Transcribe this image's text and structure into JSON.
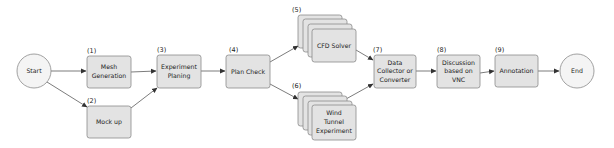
{
  "diagram": {
    "type": "flowchart",
    "colors": {
      "box_fill": "#e3e3e3",
      "box_stroke": "#8a8a8a",
      "circle_fill": "#f4f4f4",
      "edge": "#444444",
      "background": "#ffffff"
    },
    "nodes": {
      "start": {
        "label": "Start"
      },
      "n1": {
        "num": "(1)",
        "line1": "Mesh",
        "line2": "Generation"
      },
      "n2": {
        "num": "(2)",
        "line1": "Mock up"
      },
      "n3": {
        "num": "(3)",
        "line1": "Experiment",
        "line2": "Planing"
      },
      "n4": {
        "num": "(4)",
        "line1": "Plan Check"
      },
      "n5": {
        "num": "(5)",
        "line1": "CFD Solver"
      },
      "n6": {
        "num": "(6)",
        "line1": "Wind",
        "line2": "Tunnel",
        "line3": "Experiment"
      },
      "n7": {
        "num": "(7)",
        "line1": "Data",
        "line2": "Collector or",
        "line3": "Converter"
      },
      "n8": {
        "num": "(8)",
        "line1": "Discussion",
        "line2": "based on",
        "line3": "VNC"
      },
      "n9": {
        "num": "(9)",
        "line1": "Annotation"
      },
      "end": {
        "label": "End"
      }
    },
    "edges": [
      [
        "start",
        "n1"
      ],
      [
        "start",
        "n2"
      ],
      [
        "n1",
        "n3"
      ],
      [
        "n2",
        "n3"
      ],
      [
        "n3",
        "n4"
      ],
      [
        "n4",
        "n5"
      ],
      [
        "n4",
        "n6"
      ],
      [
        "n5",
        "n7"
      ],
      [
        "n6",
        "n7"
      ],
      [
        "n7",
        "n8"
      ],
      [
        "n8",
        "n9"
      ],
      [
        "n9",
        "end"
      ]
    ]
  }
}
